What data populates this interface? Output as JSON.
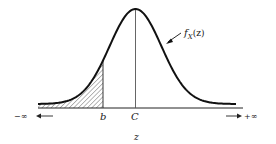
{
  "diagram": {
    "type": "probability-density-curve",
    "curve_label": "f",
    "curve_label_sub": "X",
    "curve_label_arg": "(z)",
    "axis_variable": "z",
    "mean_label": "C",
    "bound_label": "b",
    "left_infinity": "−∞",
    "right_infinity": "+∞",
    "shaded_region": "area under curve from −∞ to b",
    "colors": {
      "curve": "#111111",
      "axis": "#222222",
      "hatch": "#333333",
      "background": "#ffffff"
    }
  }
}
